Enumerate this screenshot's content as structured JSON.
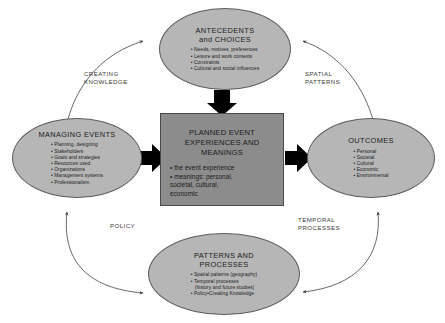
{
  "diagram": {
    "colors": {
      "ellipse_fill": "#b6b6b6",
      "ellipse_stroke": "#5d5d5d",
      "box_fill": "#8c8c8c",
      "box_stroke": "#4a4a4a",
      "arrow_black": "#000000",
      "curve_stroke": "#4d4d4d",
      "background": "#ffffff",
      "text": "#1a1a1a"
    },
    "nodes": {
      "antecedents": {
        "shape": "ellipse",
        "title": "ANTECEDENTS\nand  CHOICES",
        "items": [
          "Needs, motives, preferences",
          "Leisure and work contexts",
          "Constraints",
          "Cultural and social influences"
        ]
      },
      "managing_events": {
        "shape": "ellipse",
        "title": "MANAGING EVENTS",
        "items": [
          "Planning, designing",
          "Stakeholders",
          "Goals and strategies",
          "Resources used",
          "Organizations",
          "Management systems",
          "Professionalism"
        ]
      },
      "central": {
        "shape": "rectangle",
        "title": "PLANNED EVENT\nEXPERIENCES AND\nMEANINGS",
        "items": [
          "the event experience",
          "meanings: personal,\nsocietal, cultural,\neconomic"
        ]
      },
      "outcomes": {
        "shape": "ellipse",
        "title": "OUTCOMES",
        "items": [
          "Personal",
          "Societal",
          "Cultural",
          "Economic",
          "Environmental"
        ]
      },
      "patterns_processes": {
        "shape": "ellipse",
        "title": "PATTERNS AND\nPROCESSES",
        "items": [
          "Spatial patterns (geography)",
          "Temporal processes",
          "(history and future studies)",
          "Policy•Creating Knowledge"
        ],
        "continuation_indices": [
          2
        ]
      }
    },
    "curve_labels": {
      "creating_knowledge": "CREATING\nKNOWLEDGE",
      "spatial_patterns": "SPATIAL\nPATTERNS",
      "policy": "POLICY",
      "temporal_processes": "TEMPORAL\nPROCESSES"
    },
    "connectors": [
      {
        "name": "antecedents-to-central",
        "style": "thick-black-arrow",
        "direction": "down"
      },
      {
        "name": "managing-to-central",
        "style": "thick-black-arrow",
        "direction": "right"
      },
      {
        "name": "central-to-outcomes",
        "style": "thick-black-arrow",
        "direction": "right"
      },
      {
        "name": "managing-antecedents-curve",
        "style": "thin-curve",
        "direction": "double"
      },
      {
        "name": "antecedents-outcomes-curve",
        "style": "thin-curve",
        "direction": "double"
      },
      {
        "name": "managing-patterns-curve",
        "style": "thin-curve",
        "direction": "double"
      },
      {
        "name": "outcomes-patterns-curve",
        "style": "thin-curve",
        "direction": "double"
      }
    ]
  }
}
